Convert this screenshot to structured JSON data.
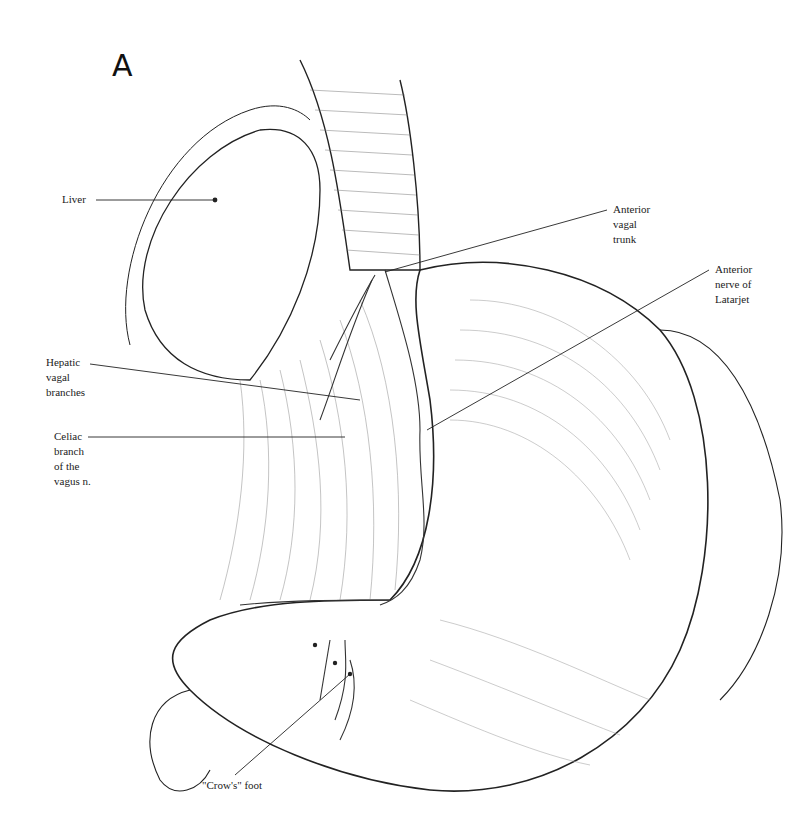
{
  "figure": {
    "panel_letter": "A"
  },
  "labels": [
    {
      "id": "liver",
      "text": "Liver"
    },
    {
      "id": "anterior-vagal-trunk",
      "text": "Anterior\nvagal\ntrunk"
    },
    {
      "id": "anterior-nerve-of-latarjet",
      "text": "Anterior\nnerve of\nLatarjet"
    },
    {
      "id": "hepatic-vagal-branches",
      "text": "Hepatic\nvagal\nbranches"
    },
    {
      "id": "celiac-branch",
      "text": "Celiac\nbranch\nof the\nvagus n."
    },
    {
      "id": "crows-foot",
      "text": "\"Crow's\" foot"
    }
  ]
}
